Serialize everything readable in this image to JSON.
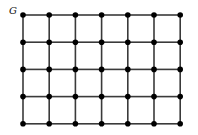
{
  "diagram": {
    "type": "grid-graph",
    "label": "G",
    "rows": 5,
    "cols": 7,
    "grid": {
      "x0": 23,
      "y0": 15,
      "dx": 26.2,
      "dy": 27.2
    },
    "node_radius": 2.8,
    "colors": {
      "edge": "#3a3a3a",
      "node": "#000000",
      "label": "#111111",
      "background": "#ffffff"
    },
    "edge_width": 1.6
  }
}
